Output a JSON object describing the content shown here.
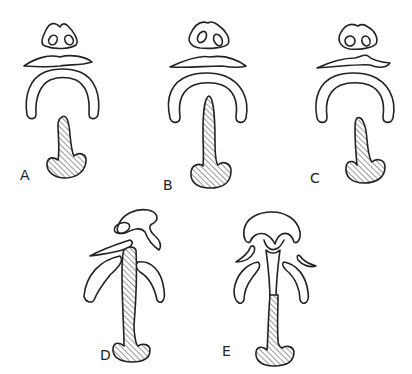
{
  "figure": {
    "panels": [
      {
        "id": "A",
        "label": "A"
      },
      {
        "id": "B",
        "label": "B"
      },
      {
        "id": "C",
        "label": "C"
      },
      {
        "id": "D",
        "label": "D"
      },
      {
        "id": "E",
        "label": "E"
      }
    ],
    "colors": {
      "ink": "#222222",
      "background": "#ffffff"
    }
  }
}
